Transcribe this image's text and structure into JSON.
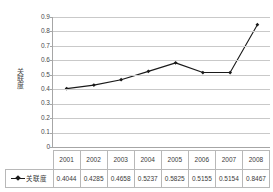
{
  "chart_data": {
    "type": "line",
    "title": "",
    "xlabel": "",
    "ylabel": "关联度",
    "categories": [
      "2001",
      "2002",
      "2003",
      "2004",
      "2005",
      "2006",
      "2007",
      "2008"
    ],
    "series": [
      {
        "name": "关联度",
        "values": [
          0.4044,
          0.4285,
          0.4658,
          0.5237,
          0.5825,
          0.5155,
          0.5154,
          0.8467
        ],
        "value_labels": [
          "0.4044",
          "0.4285",
          "0.4658",
          "0.5237",
          "0.5825",
          "0.5155",
          "0.5154",
          "0.8467"
        ],
        "color": "#1a1a1a",
        "marker": "diamond"
      }
    ],
    "ylim": [
      0,
      0.9
    ],
    "ytick_step": 0.1,
    "ytick_labels": [
      "0.9",
      "0.8",
      "0.7",
      "0.6",
      "0.5",
      "0.4",
      "0.3",
      "0.2",
      "0.1",
      "0"
    ],
    "ytick_values": [
      0.9,
      0.8,
      0.7,
      0.6,
      0.5,
      0.4,
      0.3,
      0.2,
      0.1,
      0
    ],
    "grid": "horizontal",
    "legend_position": "data-table-left",
    "has_data_table": true,
    "gridline_color": "#c9c9c9",
    "axis_color": "#a6a6a6",
    "background": "#ffffff"
  },
  "data_table": {
    "year_row": [
      "2001",
      "2002",
      "2003",
      "2004",
      "2005",
      "2006",
      "2007",
      "2008"
    ],
    "value_row": [
      "0.4044",
      "0.4285",
      "0.4658",
      "0.5237",
      "0.5825",
      "0.5155",
      "0.5154",
      "0.8467"
    ],
    "legend_label": "关联度"
  }
}
